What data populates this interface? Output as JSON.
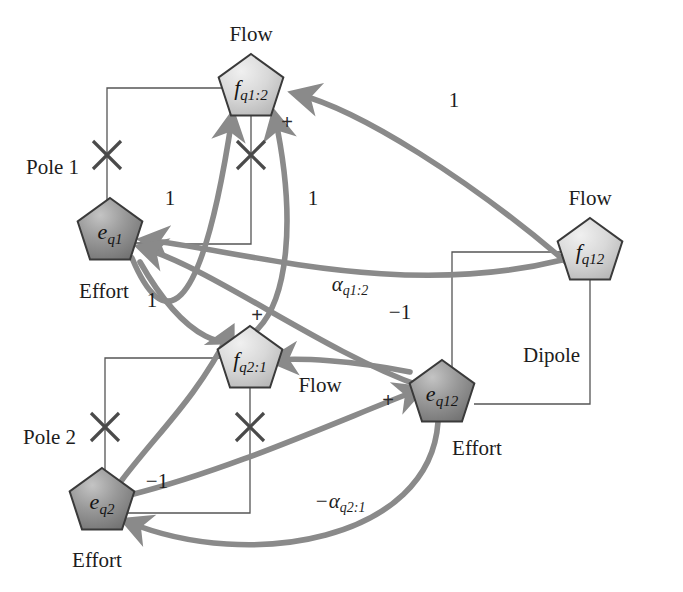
{
  "diagram": {
    "title_present": false,
    "background": "#ffffff",
    "node_fill_dark": "#8d8d8d",
    "node_fill_light": "#d0d0d0",
    "node_stroke": "#3a3a3a",
    "thin_line_color": "#555555",
    "thick_arrow_color": "#8a8a8a",
    "nodes": [
      {
        "id": "fq12node",
        "label": "f",
        "sub": "q1:2",
        "x": 251,
        "y": 88,
        "kind": "flow",
        "caption": "Flow",
        "caption_x": 251,
        "caption_y": 34,
        "fill": "light"
      },
      {
        "id": "eq1",
        "label": "e",
        "sub": "q1",
        "x": 110,
        "y": 232,
        "kind": "effort",
        "caption": "Effort",
        "caption_x": 104,
        "caption_y": 291,
        "fill": "dark"
      },
      {
        "id": "fq21",
        "label": "f",
        "sub": "q2:1",
        "x": 250,
        "y": 360,
        "kind": "flow",
        "caption": "Flow",
        "caption_x": 320,
        "caption_y": 385,
        "fill": "light"
      },
      {
        "id": "eq2",
        "label": "e",
        "sub": "q2",
        "x": 102,
        "y": 502,
        "kind": "effort",
        "caption": "Effort",
        "caption_x": 97,
        "caption_y": 560,
        "fill": "dark"
      },
      {
        "id": "eq12",
        "label": "e",
        "sub": "q12",
        "x": 442,
        "y": 394,
        "kind": "effort",
        "caption": "Effort",
        "caption_x": 477,
        "caption_y": 448,
        "fill": "dark"
      },
      {
        "id": "fq12",
        "label": "f",
        "sub": "q12",
        "x": 590,
        "y": 252,
        "kind": "flow",
        "caption": "Flow",
        "caption_x": 590,
        "caption_y": 198,
        "fill": "light"
      }
    ],
    "group_labels": [
      {
        "text": "Pole 1",
        "x": 26,
        "y": 157
      },
      {
        "text": "Pole 2",
        "x": 23,
        "y": 427
      },
      {
        "text": "Dipole",
        "x": 523,
        "y": 345
      }
    ],
    "gain_labels": [
      {
        "text": "1",
        "x": 454,
        "y": 100
      },
      {
        "text": "1",
        "x": 170,
        "y": 198
      },
      {
        "text": "1",
        "x": 313,
        "y": 198
      },
      {
        "text": "1",
        "x": 152,
        "y": 300
      },
      {
        "text": "−1",
        "x": 400,
        "y": 312
      },
      {
        "text": "−1",
        "x": 157,
        "y": 481
      }
    ],
    "alpha_labels": [
      {
        "base": "α",
        "sub": "q1:2",
        "x": 350,
        "y": 286
      },
      {
        "base": "−α",
        "sub": "q2:1",
        "x": 340,
        "y": 503
      }
    ],
    "plus_signs": [
      {
        "x": 287,
        "y": 122
      },
      {
        "x": 257,
        "y": 315
      },
      {
        "x": 388,
        "y": 400
      }
    ],
    "x_markers": [
      {
        "x": 107,
        "y": 155
      },
      {
        "x": 251,
        "y": 155
      },
      {
        "x": 105,
        "y": 427
      },
      {
        "x": 250,
        "y": 427
      }
    ],
    "thin_paths": [
      {
        "name": "pole1-outer",
        "d": "M 222,88 L 107,88 L 107,243 L 148,243"
      },
      {
        "name": "pole1-inner",
        "d": "M 251,116 L 251,244 L 145,244"
      },
      {
        "name": "pole2-outer",
        "d": "M 221,358 L 105,358 L 105,513 L 140,513"
      },
      {
        "name": "pole2-inner",
        "d": "M 250,388 L 250,513 L 140,513"
      },
      {
        "name": "dipole-outer",
        "d": "M 562,252 L 452,252 L 452,400"
      },
      {
        "name": "dipole-inner",
        "d": "M 590,280 L 590,404 L 474,404"
      }
    ],
    "thick_arrows": [
      {
        "name": "fq12-to-fq1-2",
        "d": "M 566,262 C 470,180 360,110 297,94",
        "label": "1"
      },
      {
        "name": "eq1-to-fq1-2",
        "d": "M 132,258 C 162,330 200,330 232,118",
        "label": "1"
      },
      {
        "name": "eq1-loop-right",
        "d": "M 140,262 C 230,420 320,330 275,117",
        "label": "1"
      },
      {
        "name": "fq12-to-eq1",
        "d": "M 562,260 C 400,300 240,250 146,240",
        "label": "−1"
      },
      {
        "name": "eq12-to-eq1",
        "d": "M 420,386 C 320,350 215,270 143,248",
        "label": "α q1:2"
      },
      {
        "name": "eq2-to-eq12",
        "d": "M 130,495 C 230,470 340,420 418,390",
        "label": "−1"
      },
      {
        "name": "eq2-to-fq2-1",
        "d": "M 122,480 C 160,430 195,400 230,332",
        "label": ""
      },
      {
        "name": "eq12-to-eq2",
        "d": "M 438,422 C 430,540 250,572 128,522",
        "label": "−α q2:1"
      },
      {
        "name": "x-to-fq2-1",
        "d": "M 410,372 C 350,360 300,358 275,360",
        "label": ""
      }
    ]
  }
}
